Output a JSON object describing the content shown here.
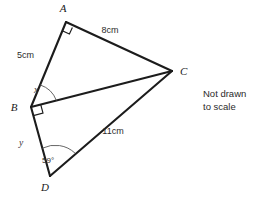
{
  "figure": {
    "note": {
      "line1": "Not drawn",
      "line2": "to scale"
    },
    "vertices": [
      {
        "id": "A",
        "label": "A",
        "x": 66,
        "y": 22,
        "label_x": 63,
        "label_y": 12
      },
      {
        "id": "B",
        "label": "B",
        "x": 31,
        "y": 107,
        "label_x": 14,
        "label_y": 111
      },
      {
        "id": "C",
        "label": "C",
        "x": 172,
        "y": 71,
        "label_x": 180,
        "label_y": 75
      },
      {
        "id": "D",
        "label": "D",
        "x": 50,
        "y": 176,
        "label_x": 45,
        "label_y": 191
      }
    ],
    "edges": [
      {
        "id": "AB",
        "from": "B",
        "to": "A"
      },
      {
        "id": "AC",
        "from": "A",
        "to": "C"
      },
      {
        "id": "BC",
        "from": "B",
        "to": "C"
      },
      {
        "id": "BD",
        "from": "B",
        "to": "D"
      },
      {
        "id": "DC",
        "from": "D",
        "to": "C"
      }
    ],
    "length_labels": [
      {
        "id": "AB-length",
        "edge": "AB",
        "text": "5cm",
        "x": 17,
        "y": 58
      },
      {
        "id": "AC-length",
        "edge": "AC",
        "text": "8cm",
        "x": 110,
        "y": 33
      },
      {
        "id": "DC-length",
        "edge": "DC",
        "text": "11cm",
        "x": 113,
        "y": 134
      }
    ],
    "angle_labels": [
      {
        "id": "angle-x",
        "at": "B",
        "text": "x",
        "x": 36,
        "y": 93
      },
      {
        "id": "angle-y",
        "at": "B",
        "text": "y",
        "x": 21,
        "y": 146
      },
      {
        "id": "angle-59",
        "at": "D",
        "text": "59°",
        "x": 42,
        "y": 163
      }
    ],
    "right_angles": [
      {
        "id": "right-angle-A",
        "at": "A"
      },
      {
        "id": "right-angle-B",
        "at": "B"
      }
    ],
    "colors": {
      "stroke": "#1c1c1c",
      "text": "#2b2b2b",
      "arc": "#555555",
      "background": "#ffffff"
    }
  }
}
